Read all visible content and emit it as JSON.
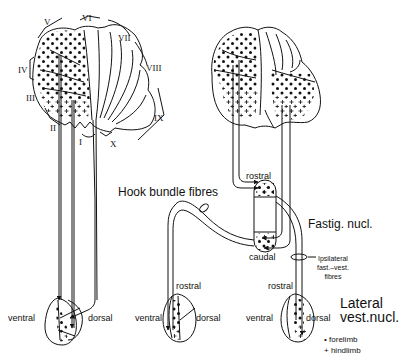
{
  "figure": {
    "left_panel": {
      "lobule_labels": [
        "I",
        "II",
        "III",
        "IV",
        "V",
        "VI",
        "VII",
        "VIII",
        "IX",
        "X"
      ],
      "nucleus_labels": {
        "ventral": "ventral",
        "dorsal": "dorsal"
      }
    },
    "right_panel": {
      "hook_bundle": "Hook bundle fibres",
      "fastigial": {
        "title": "Fastig. nucl.",
        "rostral": "rostral",
        "caudal": "caudal"
      },
      "ipsilateral": [
        "Ipsilateral",
        "fast.–vest.",
        "fibres"
      ],
      "lower_left_nucleus": {
        "rostral": "rostral",
        "ventral": "ventral",
        "dorsal": "dorsal"
      },
      "lower_right_nucleus": {
        "rostral": "rostral",
        "ventral": "ventral",
        "dorsal": "dorsal"
      },
      "lateral_vest": [
        "Lateral",
        "vest.nucl."
      ]
    },
    "legend": [
      {
        "symbol": "•",
        "label": "forelimb"
      },
      {
        "symbol": "+",
        "label": "hindlimb"
      }
    ]
  }
}
